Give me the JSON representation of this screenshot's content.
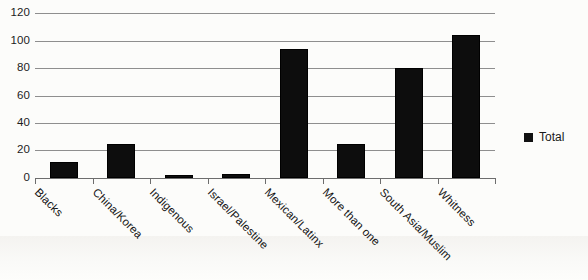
{
  "chart_data": {
    "type": "bar",
    "title": "",
    "subtitle": "",
    "xlabel": "",
    "ylabel": "",
    "categories": [
      "Blacks",
      "China/Korea",
      "Indigenous",
      "Israel/Palestine",
      "Mexican/Latinx",
      "More than one",
      "South Asia/Muslim",
      "Whitness"
    ],
    "series": [
      {
        "name": "Total",
        "values": [
          12,
          25,
          2,
          3,
          94,
          25,
          80,
          104
        ],
        "color": "#0d0d0d"
      }
    ],
    "values": [
      12,
      25,
      2,
      3,
      94,
      25,
      80,
      104
    ],
    "ylim": [
      0,
      120
    ],
    "ytick_values": [
      0,
      20,
      40,
      60,
      80,
      100,
      120
    ],
    "ytick_labels": [
      "0",
      "20",
      "40",
      "60",
      "80",
      "100",
      "120"
    ],
    "grid": true,
    "grid_axis": "y",
    "legend": {
      "position": "right",
      "entries": [
        {
          "label": "Total",
          "color": "#0d0d0d",
          "marker": "square"
        }
      ]
    },
    "xtick_label_rotation": 45,
    "bar_edge_color": "#000000",
    "gridline_color": "#8e8e8e",
    "background_color": "#fcfcfa"
  },
  "legend": {
    "total_label": "Total",
    "swatch_name": "legend-swatch-total"
  }
}
